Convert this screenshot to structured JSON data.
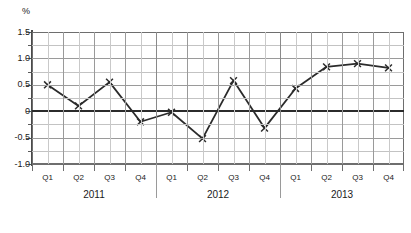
{
  "chart_data": {
    "type": "line",
    "title": "",
    "unit_label": "%",
    "xlabel": "",
    "ylabel": "",
    "ylim": [
      -1.0,
      1.5
    ],
    "grid": true,
    "legend": "none",
    "marker": "x",
    "line_color": "#2b2b2b",
    "categories": [
      "Q1",
      "Q2",
      "Q3",
      "Q4",
      "Q1",
      "Q2",
      "Q3",
      "Q4",
      "Q1",
      "Q2",
      "Q3",
      "Q4"
    ],
    "year_groups": [
      {
        "label": "2011",
        "quarters": [
          "Q1",
          "Q2",
          "Q3",
          "Q4"
        ]
      },
      {
        "label": "2012",
        "quarters": [
          "Q1",
          "Q2",
          "Q3",
          "Q4"
        ]
      },
      {
        "label": "2013",
        "quarters": [
          "Q1",
          "Q2",
          "Q3",
          "Q4"
        ]
      }
    ],
    "y_ticks": [
      "1.5",
      "1.0",
      "0.5",
      "0",
      "-0.5",
      "-1.0"
    ],
    "y_tick_values": [
      1.5,
      1.0,
      0.5,
      0,
      -0.5,
      -1.0
    ],
    "values": [
      0.5,
      0.1,
      0.55,
      -0.2,
      -0.02,
      -0.52,
      0.58,
      -0.32,
      0.43,
      0.84,
      0.9,
      0.82
    ],
    "points": [
      {
        "x": "2011 Q1",
        "y": 0.5
      },
      {
        "x": "2011 Q2",
        "y": 0.1
      },
      {
        "x": "2011 Q3",
        "y": 0.55
      },
      {
        "x": "2011 Q4",
        "y": -0.2
      },
      {
        "x": "2012 Q1",
        "y": -0.02
      },
      {
        "x": "2012 Q2",
        "y": -0.52
      },
      {
        "x": "2012 Q3",
        "y": 0.58
      },
      {
        "x": "2012 Q4",
        "y": -0.32
      },
      {
        "x": "2013 Q1",
        "y": 0.43
      },
      {
        "x": "2013 Q2",
        "y": 0.84
      },
      {
        "x": "2013 Q3",
        "y": 0.9
      },
      {
        "x": "2013 Q4",
        "y": 0.82
      }
    ]
  }
}
